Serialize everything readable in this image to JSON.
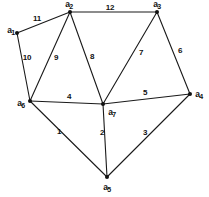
{
  "figure": {
    "background": "#ffffff",
    "stroke_color": "#1a1a1a",
    "text_color": "#111111",
    "width": 209,
    "height": 197
  },
  "nodes": [
    {
      "id": "a1",
      "base": "a",
      "sub": "1",
      "x": 17,
      "y": 33,
      "label_x": 11,
      "label_y": 31
    },
    {
      "id": "a2",
      "base": "a",
      "sub": "2",
      "x": 70,
      "y": 12,
      "label_x": 69,
      "label_y": 5
    },
    {
      "id": "a3",
      "base": "a",
      "sub": "3",
      "x": 157,
      "y": 12,
      "label_x": 157,
      "label_y": 5
    },
    {
      "id": "a4",
      "base": "a",
      "sub": "4",
      "x": 190,
      "y": 94,
      "label_x": 199,
      "label_y": 95
    },
    {
      "id": "a5",
      "base": "a",
      "sub": "5",
      "x": 107,
      "y": 177,
      "label_x": 107,
      "label_y": 188
    },
    {
      "id": "a6",
      "base": "a",
      "sub": "6",
      "x": 30,
      "y": 101,
      "label_x": 21,
      "label_y": 104
    },
    {
      "id": "a7",
      "base": "a",
      "sub": "7",
      "x": 103,
      "y": 104,
      "label_x": 112,
      "label_y": 113
    }
  ],
  "edges": [
    {
      "from": "a1",
      "to": "a2",
      "weight": "11",
      "label_x": 37,
      "label_y": 19
    },
    {
      "from": "a1",
      "to": "a6",
      "weight": "10",
      "label_x": 27,
      "label_y": 58
    },
    {
      "from": "a2",
      "to": "a3",
      "weight": "12",
      "label_x": 110,
      "label_y": 8
    },
    {
      "from": "a2",
      "to": "a6",
      "weight": "9",
      "label_x": 56,
      "label_y": 58
    },
    {
      "from": "a2",
      "to": "a7",
      "weight": "8",
      "label_x": 92,
      "label_y": 57
    },
    {
      "from": "a3",
      "to": "a7",
      "weight": "7",
      "label_x": 141,
      "label_y": 53
    },
    {
      "from": "a3",
      "to": "a4",
      "weight": "6",
      "label_x": 180,
      "label_y": 51
    },
    {
      "from": "a4",
      "to": "a7",
      "weight": "5",
      "label_x": 145,
      "label_y": 93
    },
    {
      "from": "a6",
      "to": "a7",
      "weight": "4",
      "label_x": 69,
      "label_y": 97
    },
    {
      "from": "a4",
      "to": "a5",
      "weight": "3",
      "label_x": 145,
      "label_y": 133
    },
    {
      "from": "a5",
      "to": "a7",
      "weight": "2",
      "label_x": 102,
      "label_y": 133
    },
    {
      "from": "a5",
      "to": "a6",
      "weight": "1",
      "label_x": 59,
      "label_y": 132
    }
  ]
}
